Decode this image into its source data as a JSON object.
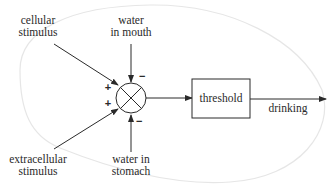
{
  "diagram": {
    "type": "block-diagram",
    "inputs": {
      "cellular": {
        "line1": "cellular",
        "line2": "stimulus",
        "sign": "+"
      },
      "extracellular": {
        "line1": "extracellular",
        "line2": "stimulus",
        "sign": "+"
      },
      "mouth": {
        "line1": "water",
        "line2": "in mouth",
        "sign": "−"
      },
      "stomach": {
        "line1": "water in",
        "line2": "stomach",
        "sign": "−"
      }
    },
    "junction": {
      "kind": "summing-junction"
    },
    "threshold": {
      "label": "threshold"
    },
    "output": {
      "label": "drinking"
    },
    "colors": {
      "line": "#2a2a2a",
      "boundary": "#e4e4e4",
      "background": "#ffffff"
    }
  }
}
